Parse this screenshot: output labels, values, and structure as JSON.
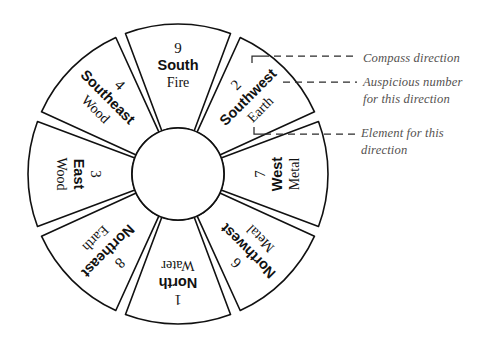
{
  "diagram": {
    "type": "radial-segment-wheel",
    "segment_count": 8,
    "geometry": {
      "center_x": 178,
      "center_y": 174,
      "outer_radius": 150,
      "inner_radius": 46,
      "gap_degrees": 4
    },
    "colors": {
      "stroke": "#111111",
      "background": "#ffffff",
      "annotation_text": "#54514f",
      "callout_line": "#2b2b2b"
    },
    "segments": [
      {
        "id": "south",
        "number": "9",
        "direction": "South",
        "element": "Fire",
        "center_angle_deg": 270,
        "text_rotation_deg": 0
      },
      {
        "id": "southwest",
        "number": "2",
        "direction": "Southwest",
        "element": "Earth",
        "center_angle_deg": 315,
        "text_rotation_deg": -45
      },
      {
        "id": "west",
        "number": "7",
        "direction": "West",
        "element": "Metal",
        "center_angle_deg": 0,
        "text_rotation_deg": -90
      },
      {
        "id": "northwest",
        "number": "6",
        "direction": "Northwest",
        "element": "Metal",
        "center_angle_deg": 45,
        "text_rotation_deg": -135
      },
      {
        "id": "north",
        "number": "1",
        "direction": "North",
        "element": "Water",
        "center_angle_deg": 90,
        "text_rotation_deg": 180
      },
      {
        "id": "northeast",
        "number": "8",
        "direction": "Northeast",
        "element": "Earth",
        "center_angle_deg": 135,
        "text_rotation_deg": 135
      },
      {
        "id": "east",
        "number": "3",
        "direction": "East",
        "element": "Wood",
        "center_angle_deg": 180,
        "text_rotation_deg": 90
      },
      {
        "id": "southeast",
        "number": "4",
        "direction": "Southeast",
        "element": "Wood",
        "center_angle_deg": 225,
        "text_rotation_deg": 45
      }
    ]
  },
  "annotations": [
    {
      "id": "compass-direction",
      "text": "Compass direction",
      "target_segment": "southwest",
      "target_field": "direction"
    },
    {
      "id": "auspicious-number",
      "text": "Auspicious number\nfor this direction",
      "target_segment": "southwest",
      "target_field": "number"
    },
    {
      "id": "element",
      "text": "Element for this\ndirection",
      "target_segment": "southwest",
      "target_field": "element"
    }
  ]
}
